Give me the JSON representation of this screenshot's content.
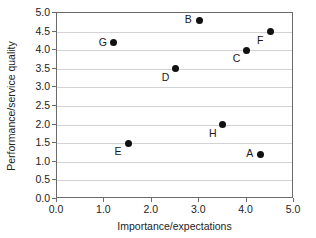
{
  "chart_data": {
    "type": "scatter",
    "title": "",
    "xlabel": "Importance/expectations",
    "ylabel": "Performance/service quality",
    "xlim": [
      0.0,
      5.0
    ],
    "ylim": [
      0.0,
      5.0
    ],
    "xticks": [
      "0.0",
      "1.0",
      "2.0",
      "3.0",
      "4.0",
      "5.0"
    ],
    "xtick_values": [
      0.0,
      1.0,
      2.0,
      3.0,
      4.0,
      5.0
    ],
    "yticks": [
      "0.0",
      "0.5",
      "1.0",
      "1.5",
      "2.0",
      "2.5",
      "3.0",
      "3.5",
      "4.0",
      "4.5",
      "5.0"
    ],
    "ytick_values": [
      0.0,
      0.5,
      1.0,
      1.5,
      2.0,
      2.5,
      3.0,
      3.5,
      4.0,
      4.5,
      5.0
    ],
    "grid": "horizontal",
    "legend": "none",
    "marker_color": "#111111",
    "gridline_color": "#d3d3d3",
    "axis_color": "#6b6b6b",
    "points": [
      {
        "label": "A",
        "x": 4.3,
        "y": 1.2,
        "label_pos": "left"
      },
      {
        "label": "B",
        "x": 3.0,
        "y": 4.8,
        "label_pos": "left"
      },
      {
        "label": "C",
        "x": 4.0,
        "y": 4.0,
        "label_pos": "below-left"
      },
      {
        "label": "D",
        "x": 2.5,
        "y": 3.5,
        "label_pos": "below-left"
      },
      {
        "label": "E",
        "x": 1.5,
        "y": 1.5,
        "label_pos": "below-left"
      },
      {
        "label": "F",
        "x": 4.5,
        "y": 4.5,
        "label_pos": "below-left"
      },
      {
        "label": "G",
        "x": 1.2,
        "y": 4.2,
        "label_pos": "left"
      },
      {
        "label": "H",
        "x": 3.5,
        "y": 2.0,
        "label_pos": "below-left"
      }
    ]
  }
}
